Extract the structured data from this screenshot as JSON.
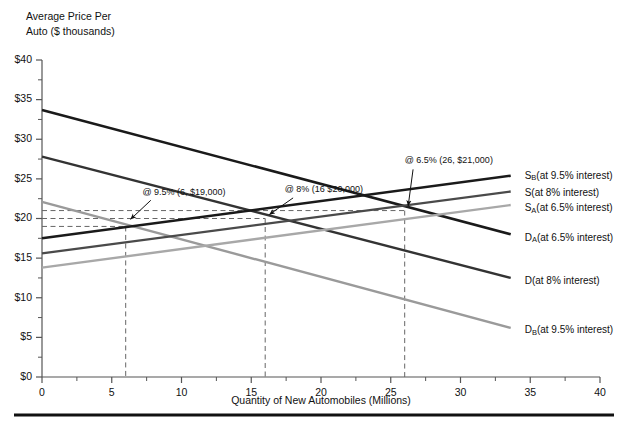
{
  "chart_data": {
    "type": "line",
    "title": "",
    "xlabel": "Quantity of New Automobiles (Millions)",
    "ylabel_line1": "Average Price Per",
    "ylabel_line2": "Auto ($ thousands)",
    "xlim": [
      0,
      40
    ],
    "ylim": [
      0,
      40
    ],
    "xticks": [
      "0",
      "5",
      "10",
      "15",
      "20",
      "25",
      "30",
      "35",
      "40"
    ],
    "xtick_values": [
      0,
      5,
      10,
      15,
      20,
      25,
      30,
      35,
      40
    ],
    "yticks": [
      "$0",
      "$5",
      "$10",
      "$15",
      "$20",
      "$25",
      "$30",
      "$35",
      "$40"
    ],
    "ytick_values": [
      0,
      5,
      10,
      15,
      20,
      25,
      30,
      35,
      40
    ],
    "minor_ytick_values": [
      2.5,
      7.5,
      12.5,
      17.5,
      22.5,
      27.5,
      32.5,
      37.5
    ],
    "grid": false,
    "legend_position": "right-inline",
    "series": [
      {
        "name": "D_A(at 6.5% interest)",
        "label_main": "D",
        "label_sub": "A",
        "label_rest": "(at 6.5% interest)",
        "kind": "demand",
        "color": "#1a1a1a",
        "width": 2.6,
        "x": [
          0,
          33.6
        ],
        "y": [
          33.7,
          18.0
        ],
        "label_x": 34.6,
        "label_y": 17.6
      },
      {
        "name": "D(at 8% interest)",
        "label_main": "D",
        "label_sub": "",
        "label_rest": "(at 8% interest)",
        "kind": "demand",
        "color": "#333333",
        "width": 2.4,
        "x": [
          0,
          33.6
        ],
        "y": [
          27.8,
          12.5
        ],
        "label_x": 34.6,
        "label_y": 12.1
      },
      {
        "name": "D_B(at 9.5% interest)",
        "label_main": "D",
        "label_sub": "B",
        "label_rest": "(at 9.5% interest)",
        "kind": "demand",
        "color": "#9a9a9a",
        "width": 2.4,
        "x": [
          0,
          33.6
        ],
        "y": [
          22.1,
          6.2
        ],
        "label_x": 34.6,
        "label_y": 5.9
      },
      {
        "name": "S_B(at 9.5% interest)",
        "label_main": "S",
        "label_sub": "B",
        "label_rest": "(at 9.5% interest)",
        "kind": "supply",
        "color": "#1a1a1a",
        "width": 2.6,
        "x": [
          0,
          33.6
        ],
        "y": [
          17.5,
          25.4
        ],
        "label_x": 34.6,
        "label_y": 25.4
      },
      {
        "name": "S(at 8% interest)",
        "label_main": "S",
        "label_sub": "",
        "label_rest": "(at 8% interest)",
        "kind": "supply",
        "color": "#4a4a4a",
        "width": 2.4,
        "x": [
          0,
          33.6
        ],
        "y": [
          15.6,
          23.4
        ],
        "label_x": 34.6,
        "label_y": 23.2
      },
      {
        "name": "S_A(at 6.5% interest)",
        "label_main": "S",
        "label_sub": "A",
        "label_rest": "(at 6.5% interest)",
        "kind": "supply",
        "color": "#a8a8a8",
        "width": 2.4,
        "x": [
          0,
          33.6
        ],
        "y": [
          13.8,
          21.7
        ],
        "label_x": 34.6,
        "label_y": 21.3
      }
    ],
    "equilibria": [
      {
        "id": "eq-9-5",
        "text": "@ 9.5% (6, $19,000)",
        "q": 6,
        "p": 19,
        "text_x": 7.2,
        "text_y": 23.3,
        "arrow_from_x": 7.8,
        "arrow_from_y": 22.3,
        "arrow_to_x": 6.35,
        "arrow_to_y": 19.9
      },
      {
        "id": "eq-8",
        "text": "@ 8% (16 $20,000)",
        "q": 16,
        "p": 20,
        "text_x": 17.4,
        "text_y": 23.6,
        "arrow_from_x": 18.0,
        "arrow_from_y": 22.6,
        "arrow_to_x": 16.3,
        "arrow_to_y": 20.5
      },
      {
        "id": "eq-6-5",
        "text": "@ 6.5% (26, $21,000)",
        "q": 26,
        "p": 21,
        "text_x": 26.0,
        "text_y": 27.3,
        "arrow_from_x": 26.6,
        "arrow_from_y": 26.2,
        "arrow_to_x": 26.25,
        "arrow_to_y": 21.6
      }
    ],
    "dashed_price_lines": [
      19,
      20,
      21
    ],
    "dashed_quantity_lines": [
      6,
      16,
      26
    ],
    "footer_rule": true
  }
}
